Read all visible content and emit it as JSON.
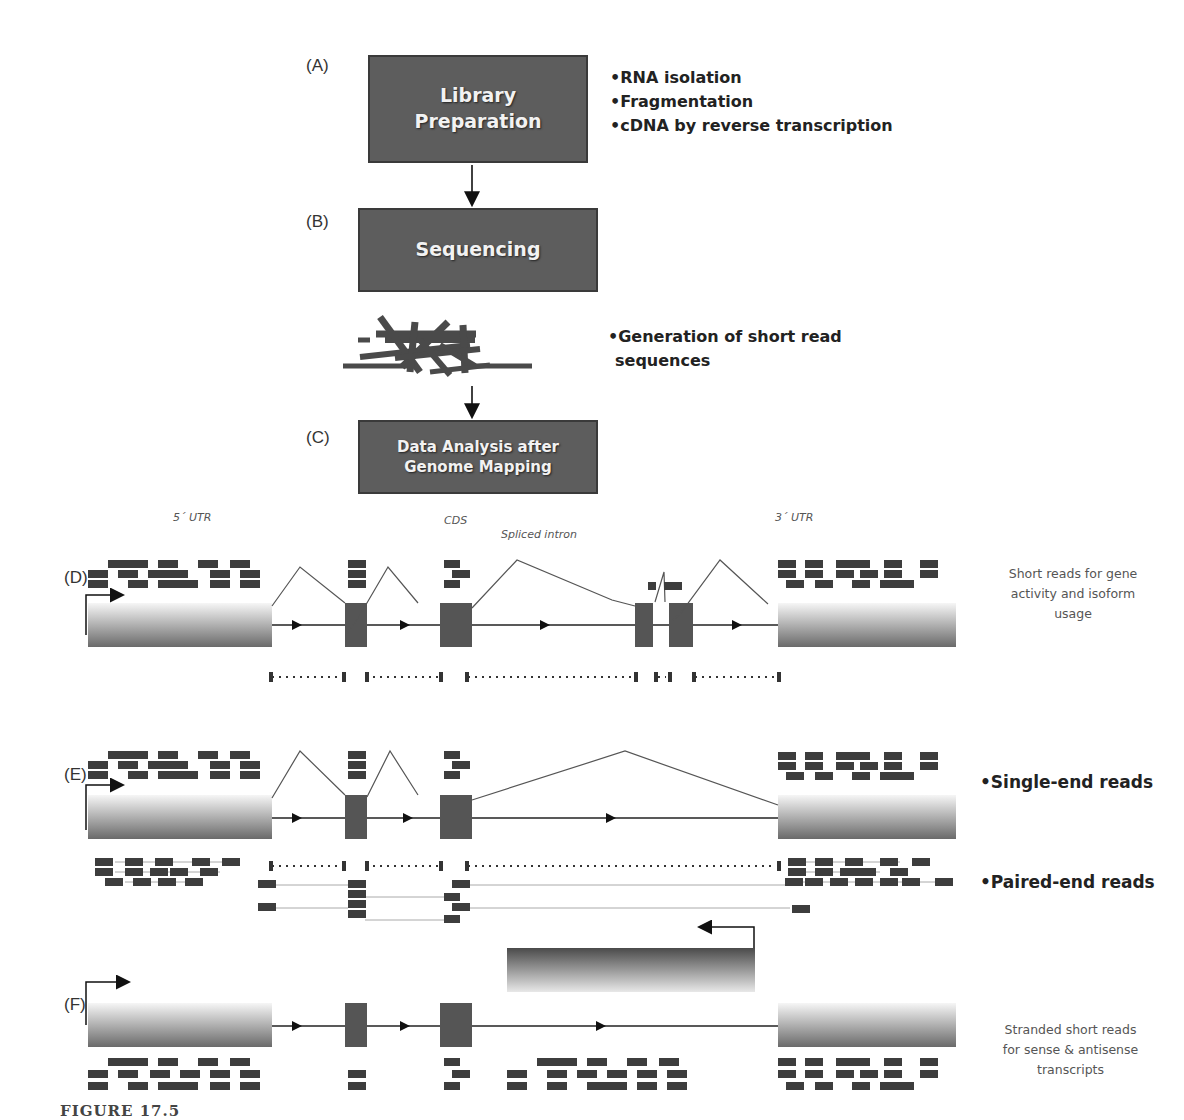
{
  "workflow": {
    "steps": [
      {
        "id": "A",
        "panel_label": "(A)",
        "box_text": "Library\nPreparation",
        "notes": [
          "•RNA isolation",
          "•Fragmentation",
          "•cDNA by reverse transcription"
        ]
      },
      {
        "id": "B",
        "panel_label": "(B)",
        "box_text": "Sequencing",
        "notes": [
          "•Generation of short read",
          "sequences"
        ]
      },
      {
        "id": "C",
        "panel_label": "(C)",
        "box_text": "Data Analysis after\nGenome Mapping",
        "notes": []
      }
    ]
  },
  "gene_model": {
    "region_labels": {
      "utr5": "5´ UTR",
      "cds": "CDS",
      "spliced_intron": "Spliced intron",
      "utr3": "3´ UTR"
    }
  },
  "panels": {
    "D": {
      "label": "(D)",
      "note": "Short reads for gene\nactivity and isoform\nusage"
    },
    "E": {
      "label": "(E)",
      "note_single": "•Single-end reads",
      "note_paired": "•Paired-end reads"
    },
    "F": {
      "label": "(F)",
      "note": "Stranded short reads\nfor sense & antisense\ntranscripts"
    }
  },
  "caption": "FIGURE 17.5",
  "colors": {
    "box_fill": "#5d5d5d",
    "exon": "#555555",
    "read": "#3d3d3d",
    "line": "#333333",
    "utr_light": "#f4f4f4",
    "utr_dark": "#6a6a6a"
  }
}
